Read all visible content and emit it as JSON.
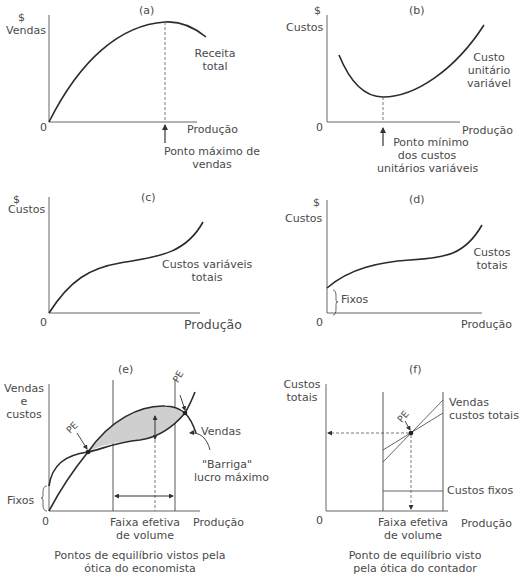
{
  "panels": {
    "a": {
      "tag": "(a)",
      "y_unit": "$",
      "y_label": "Vendas",
      "origin": "0",
      "x_label": "Produção",
      "curve_label_1": "Receita",
      "curve_label_2": "total",
      "note_1": "Ponto máximo de",
      "note_2": "vendas"
    },
    "b": {
      "tag": "(b)",
      "y_unit": "$",
      "y_label": "Custos",
      "origin": "0",
      "x_label": "Produção",
      "curve_label_1": "Custo",
      "curve_label_2": "unitário",
      "curve_label_3": "variável",
      "note_1": "Ponto mínimo",
      "note_2": "dos custos",
      "note_3": "unitários variáveis"
    },
    "c": {
      "tag": "(c)",
      "y_unit": "$",
      "y_label": "Custos",
      "origin": "0",
      "x_label": "Produção",
      "curve_label_1": "Custos variáveis",
      "curve_label_2": "totais"
    },
    "d": {
      "tag": "(d)",
      "y_unit": "$",
      "y_label": "Custos",
      "origin": "0",
      "x_label": "Produção",
      "curve_label_1": "Custos",
      "curve_label_2": "totais",
      "fixed_label": "Fixos"
    },
    "e": {
      "tag": "(e)",
      "y_label_1": "Vendas",
      "y_label_2": "e",
      "y_label_3": "custos",
      "origin": "0",
      "x_label": "Produção",
      "pe_label_1": "PE",
      "pe_label_2": "PE",
      "sales_label": "Vendas",
      "belly_label_1": "\"Barriga\"",
      "belly_label_2": "lucro máximo",
      "fixed_label": "Fixos",
      "range_label_1": "Faixa efetiva",
      "range_label_2": "de volume",
      "caption_1": "Pontos de equilíbrio vistos pela",
      "caption_2": "ótica do economista"
    },
    "f": {
      "tag": "(f)",
      "y_label_1": "Custos",
      "y_label_2": "totais",
      "origin": "0",
      "x_label": "Produção",
      "pe_label": "PE",
      "lines_label_1": "Vendas",
      "lines_label_2": "custos totais",
      "fixed_label": "Custos fixos",
      "range_label_1": "Faixa efetiva",
      "range_label_2": "de volume",
      "caption_1": "Ponto de equilíbrio visto",
      "caption_2": "pela ótica do contador"
    }
  },
  "colors": {
    "line": "#2b2b2b",
    "thin_line": "#555555",
    "fill": "#cfcfcf",
    "text": "#4a4a4a"
  }
}
